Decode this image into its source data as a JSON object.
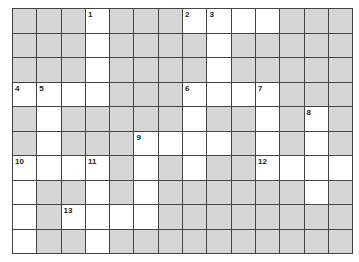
{
  "crossword": {
    "cols": 14,
    "rows": 10,
    "colors": {
      "block": "#d6d6d6",
      "open": "#ffffff",
      "line": "#444444"
    },
    "layout": [
      "00010001111000",
      "00010000100000",
      "00010000100000",
      "11110001111000",
      "01000001001010",
      "01000111101010",
      "11110101001111",
      "10010100000010",
      "10111100000000",
      "10010000000000"
    ],
    "numbers": [
      {
        "n": "1",
        "row": 0,
        "col": 3
      },
      {
        "n": "2",
        "row": 0,
        "col": 7
      },
      {
        "n": "3",
        "row": 0,
        "col": 8
      },
      {
        "n": "4",
        "row": 3,
        "col": 0
      },
      {
        "n": "5",
        "row": 3,
        "col": 1
      },
      {
        "n": "6",
        "row": 3,
        "col": 7
      },
      {
        "n": "7",
        "row": 3,
        "col": 10
      },
      {
        "n": "8",
        "row": 4,
        "col": 12
      },
      {
        "n": "9",
        "row": 5,
        "col": 5
      },
      {
        "n": "10",
        "row": 6,
        "col": 0
      },
      {
        "n": "11",
        "row": 6,
        "col": 3
      },
      {
        "n": "12",
        "row": 6,
        "col": 10
      },
      {
        "n": "13",
        "row": 8,
        "col": 2
      }
    ]
  }
}
